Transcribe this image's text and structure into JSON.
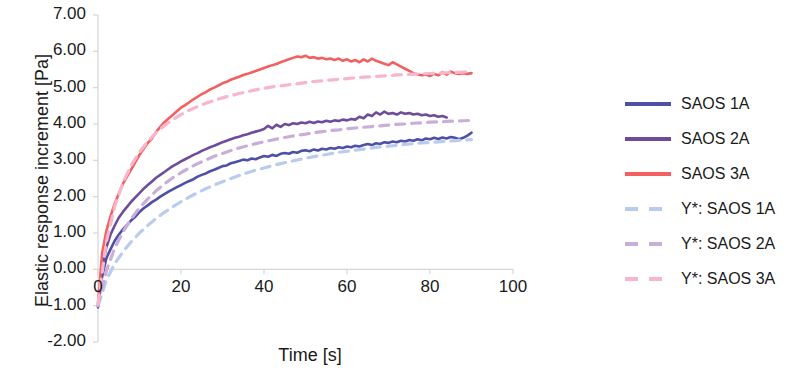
{
  "chart_data": {
    "type": "line",
    "title": "",
    "xlabel": "Time [s]",
    "ylabel": "Elastic response increment [Pa]",
    "xlim": [
      0,
      100
    ],
    "ylim": [
      -2.0,
      7.0
    ],
    "xticks": [
      "0",
      "20",
      "40",
      "60",
      "80",
      "100"
    ],
    "xtick_values": [
      0,
      20,
      40,
      60,
      80,
      100
    ],
    "yticks": [
      "7.00",
      "6.00",
      "5.00",
      "4.00",
      "3.00",
      "2.00",
      "1.00",
      "0.00",
      "-1.00",
      "-2.00"
    ],
    "ytick_values": [
      7.0,
      6.0,
      5.0,
      4.0,
      3.0,
      2.0,
      1.0,
      0.0,
      -1.0,
      -2.0
    ],
    "grid": false,
    "legend_position": "right",
    "colors": {
      "saos1a": "#4E4FA8",
      "saos2a": "#6D4D9B",
      "saos3a": "#F2615F",
      "fit1a": "#B9CCEE",
      "fit2a": "#C9AFD8",
      "fit3a": "#F8B5CE",
      "axis": "#D6D6D6",
      "text": "#1A1A1A"
    },
    "series": [
      {
        "name": "SAOS 1A",
        "style": "solid",
        "color": "#4E4FA8",
        "x": [
          0,
          1,
          2,
          3,
          4,
          5,
          6,
          7,
          8,
          9,
          10,
          11,
          12,
          13,
          14,
          15,
          16,
          17,
          18,
          19,
          20,
          21,
          22,
          23,
          24,
          25,
          26,
          27,
          28,
          29,
          30,
          31,
          32,
          33,
          34,
          35,
          36,
          37,
          38,
          39,
          40,
          41,
          42,
          43,
          44,
          45,
          46,
          47,
          48,
          49,
          50,
          51,
          52,
          53,
          54,
          55,
          56,
          57,
          58,
          59,
          60,
          61,
          62,
          63,
          64,
          65,
          66,
          67,
          68,
          69,
          70,
          71,
          72,
          73,
          74,
          75,
          76,
          77,
          78,
          79,
          80,
          81,
          82,
          83,
          84,
          85,
          86,
          87,
          88,
          89,
          90
        ],
        "y": [
          -1.05,
          -0.2,
          0.3,
          0.55,
          0.78,
          0.95,
          1.1,
          1.22,
          1.35,
          1.45,
          1.58,
          1.68,
          1.76,
          1.85,
          1.92,
          2.0,
          2.07,
          2.14,
          2.2,
          2.26,
          2.32,
          2.38,
          2.43,
          2.48,
          2.55,
          2.6,
          2.64,
          2.7,
          2.74,
          2.79,
          2.84,
          2.86,
          2.92,
          2.95,
          2.98,
          3.02,
          3.0,
          3.05,
          3.03,
          3.08,
          3.12,
          3.1,
          3.15,
          3.12,
          3.18,
          3.2,
          3.18,
          3.23,
          3.21,
          3.26,
          3.28,
          3.25,
          3.3,
          3.27,
          3.32,
          3.3,
          3.34,
          3.32,
          3.36,
          3.34,
          3.38,
          3.36,
          3.4,
          3.38,
          3.42,
          3.45,
          3.42,
          3.47,
          3.45,
          3.5,
          3.48,
          3.52,
          3.5,
          3.54,
          3.52,
          3.56,
          3.54,
          3.58,
          3.55,
          3.6,
          3.58,
          3.62,
          3.59,
          3.63,
          3.6,
          3.64,
          3.62,
          3.58,
          3.62,
          3.68,
          3.76
        ]
      },
      {
        "name": "SAOS 2A",
        "style": "solid",
        "color": "#6D4D9B",
        "x": [
          0,
          1,
          2,
          3,
          4,
          5,
          6,
          7,
          8,
          9,
          10,
          11,
          12,
          13,
          14,
          15,
          16,
          17,
          18,
          19,
          20,
          21,
          22,
          23,
          24,
          25,
          26,
          27,
          28,
          29,
          30,
          31,
          32,
          33,
          34,
          35,
          36,
          37,
          38,
          39,
          40,
          41,
          42,
          43,
          44,
          45,
          46,
          47,
          48,
          49,
          50,
          51,
          52,
          53,
          54,
          55,
          56,
          57,
          58,
          59,
          60,
          61,
          62,
          63,
          64,
          65,
          66,
          67,
          68,
          69,
          70,
          71,
          72,
          73,
          74,
          75,
          76,
          77,
          78,
          79,
          80,
          81,
          82,
          83,
          84
        ],
        "y": [
          -1.02,
          0.05,
          0.6,
          0.95,
          1.2,
          1.42,
          1.58,
          1.72,
          1.86,
          1.98,
          2.1,
          2.22,
          2.32,
          2.42,
          2.52,
          2.6,
          2.68,
          2.76,
          2.84,
          2.9,
          2.97,
          3.03,
          3.09,
          3.15,
          3.2,
          3.26,
          3.31,
          3.36,
          3.4,
          3.45,
          3.5,
          3.54,
          3.58,
          3.62,
          3.65,
          3.69,
          3.72,
          3.76,
          3.79,
          3.82,
          3.86,
          3.95,
          3.88,
          3.98,
          3.92,
          4.0,
          3.97,
          4.02,
          4.0,
          4.04,
          4.02,
          4.06,
          4.03,
          4.07,
          4.05,
          4.09,
          4.06,
          4.1,
          4.08,
          4.12,
          4.1,
          4.14,
          4.12,
          4.2,
          4.16,
          4.26,
          4.22,
          4.32,
          4.26,
          4.34,
          4.28,
          4.3,
          4.26,
          4.32,
          4.28,
          4.3,
          4.26,
          4.28,
          4.24,
          4.26,
          4.22,
          4.24,
          4.2,
          4.22,
          4.18
        ]
      },
      {
        "name": "SAOS 3A",
        "style": "solid",
        "color": "#F2615F",
        "x": [
          0,
          1,
          2,
          3,
          4,
          5,
          6,
          7,
          8,
          9,
          10,
          11,
          12,
          13,
          14,
          15,
          16,
          17,
          18,
          19,
          20,
          21,
          22,
          23,
          24,
          25,
          26,
          27,
          28,
          29,
          30,
          31,
          32,
          33,
          34,
          35,
          36,
          37,
          38,
          39,
          40,
          41,
          42,
          43,
          44,
          45,
          46,
          47,
          48,
          49,
          50,
          51,
          52,
          53,
          54,
          55,
          56,
          57,
          58,
          59,
          60,
          61,
          62,
          63,
          64,
          65,
          66,
          67,
          68,
          69,
          70,
          71,
          72,
          73,
          74,
          75,
          76,
          77,
          78,
          79,
          80,
          81,
          82,
          83,
          84,
          85,
          86,
          87,
          88,
          89,
          90
        ],
        "y": [
          -0.95,
          0.45,
          1.05,
          1.45,
          1.8,
          2.08,
          2.35,
          2.55,
          2.75,
          2.95,
          3.15,
          3.32,
          3.48,
          3.6,
          3.78,
          3.92,
          4.05,
          4.15,
          4.25,
          4.35,
          4.45,
          4.52,
          4.6,
          4.68,
          4.75,
          4.82,
          4.88,
          4.95,
          5.0,
          5.06,
          5.12,
          5.16,
          5.22,
          5.26,
          5.3,
          5.35,
          5.38,
          5.42,
          5.46,
          5.5,
          5.54,
          5.58,
          5.62,
          5.65,
          5.7,
          5.74,
          5.78,
          5.82,
          5.86,
          5.84,
          5.88,
          5.82,
          5.84,
          5.8,
          5.82,
          5.78,
          5.8,
          5.76,
          5.8,
          5.74,
          5.78,
          5.72,
          5.76,
          5.7,
          5.78,
          5.72,
          5.8,
          5.74,
          5.7,
          5.66,
          5.62,
          5.7,
          5.64,
          5.58,
          5.52,
          5.46,
          5.4,
          5.36,
          5.34,
          5.36,
          5.32,
          5.38,
          5.34,
          5.42,
          5.36,
          5.44,
          5.4,
          5.38,
          5.4,
          5.38,
          5.4
        ]
      },
      {
        "name": "Y*: SAOS 1A",
        "style": "dashed",
        "color": "#B9CCEE",
        "x": [
          0,
          2,
          4,
          6,
          8,
          10,
          12,
          14,
          16,
          18,
          20,
          22,
          24,
          26,
          28,
          30,
          32,
          34,
          36,
          38,
          40,
          42,
          44,
          46,
          48,
          50,
          52,
          54,
          56,
          58,
          60,
          62,
          64,
          66,
          68,
          70,
          72,
          74,
          76,
          78,
          80,
          82,
          84,
          86,
          88,
          90
        ],
        "y": [
          -1.0,
          -0.3,
          0.15,
          0.48,
          0.76,
          1.0,
          1.21,
          1.4,
          1.57,
          1.72,
          1.86,
          1.99,
          2.11,
          2.22,
          2.32,
          2.41,
          2.5,
          2.58,
          2.66,
          2.73,
          2.79,
          2.85,
          2.91,
          2.96,
          3.01,
          3.06,
          3.1,
          3.14,
          3.18,
          3.22,
          3.25,
          3.28,
          3.31,
          3.34,
          3.37,
          3.39,
          3.41,
          3.44,
          3.46,
          3.48,
          3.49,
          3.51,
          3.53,
          3.54,
          3.56,
          3.57
        ]
      },
      {
        "name": "Y*: SAOS 2A",
        "style": "dashed",
        "color": "#C9AFD8",
        "x": [
          0,
          2,
          4,
          6,
          8,
          10,
          12,
          14,
          16,
          18,
          20,
          22,
          24,
          26,
          28,
          30,
          32,
          34,
          36,
          38,
          40,
          42,
          44,
          46,
          48,
          50,
          52,
          54,
          56,
          58,
          60,
          62,
          64,
          66,
          68,
          70,
          72,
          74,
          76,
          78,
          80,
          82,
          84,
          86,
          88,
          90
        ],
        "y": [
          -1.0,
          -0.05,
          0.58,
          1.03,
          1.39,
          1.69,
          1.94,
          2.16,
          2.35,
          2.52,
          2.66,
          2.79,
          2.91,
          3.01,
          3.11,
          3.19,
          3.27,
          3.34,
          3.4,
          3.46,
          3.51,
          3.56,
          3.61,
          3.65,
          3.69,
          3.72,
          3.76,
          3.79,
          3.82,
          3.84,
          3.87,
          3.89,
          3.91,
          3.93,
          3.95,
          3.97,
          3.99,
          4.0,
          4.02,
          4.03,
          4.05,
          4.06,
          4.07,
          4.08,
          4.09,
          4.1
        ]
      },
      {
        "name": "Y*: SAOS 3A",
        "style": "dashed",
        "color": "#F8B5CE",
        "x": [
          0,
          2,
          4,
          6,
          8,
          10,
          12,
          14,
          16,
          18,
          20,
          22,
          24,
          26,
          28,
          30,
          32,
          34,
          36,
          38,
          40,
          42,
          44,
          46,
          48,
          50,
          52,
          54,
          56,
          58,
          60,
          62,
          64,
          66,
          68,
          70,
          72,
          74,
          76,
          78,
          80,
          82,
          84,
          86,
          88,
          90
        ],
        "y": [
          -0.95,
          0.75,
          1.72,
          2.38,
          2.86,
          3.23,
          3.52,
          3.76,
          3.96,
          4.12,
          4.26,
          4.38,
          4.48,
          4.57,
          4.65,
          4.72,
          4.78,
          4.84,
          4.89,
          4.94,
          4.98,
          5.02,
          5.05,
          5.08,
          5.11,
          5.14,
          5.17,
          5.19,
          5.21,
          5.23,
          5.25,
          5.27,
          5.29,
          5.3,
          5.32,
          5.33,
          5.35,
          5.36,
          5.37,
          5.38,
          5.39,
          5.4,
          5.41,
          5.42,
          5.43,
          5.44
        ]
      }
    ],
    "legend": [
      {
        "label": "SAOS 1A",
        "color": "#4E4FA8",
        "style": "solid"
      },
      {
        "label": "SAOS 2A",
        "color": "#6D4D9B",
        "style": "solid"
      },
      {
        "label": "SAOS 3A",
        "color": "#F2615F",
        "style": "solid"
      },
      {
        "label": "Y*: SAOS 1A",
        "color": "#B9CCEE",
        "style": "dashed"
      },
      {
        "label": "Y*: SAOS 2A",
        "color": "#C9AFD8",
        "style": "dashed"
      },
      {
        "label": "Y*: SAOS 3A",
        "color": "#F8B5CE",
        "style": "dashed"
      }
    ]
  }
}
